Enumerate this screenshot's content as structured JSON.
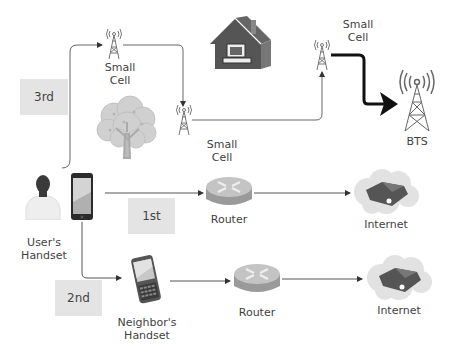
{
  "diagram": {
    "steps": [
      {
        "id": "first",
        "label": "1st"
      },
      {
        "id": "second",
        "label": "2nd"
      },
      {
        "id": "third",
        "label": "3rd"
      }
    ],
    "nodes": {
      "small_cell_a": {
        "label_line1": "Small",
        "label_line2": "Cell"
      },
      "small_cell_b": {
        "label_line1": "Small",
        "label_line2": "Cell"
      },
      "small_cell_c": {
        "label_line1": "Small",
        "label_line2": "Cell"
      },
      "bts": {
        "label": "BTS"
      },
      "users_handset": {
        "label_line1": "User's",
        "label_line2": "Handset"
      },
      "neighbors_handset": {
        "label_line1": "Neighbor's",
        "label_line2": "Handset"
      },
      "router_a": {
        "label": "Router"
      },
      "router_b": {
        "label": "Router"
      },
      "internet_a": {
        "label": "Internet"
      },
      "internet_b": {
        "label": "Internet"
      }
    },
    "icons": [
      "house-icon",
      "tree-icon",
      "person-icon",
      "smartphone-icon",
      "pda-phone-icon",
      "cell-tower-icon",
      "router-icon",
      "internet-cloud-icon"
    ],
    "colors": {
      "line": "#555555",
      "thick_line": "#1a1a1a",
      "step_box": "#e4e4e4",
      "icon_gray": "#666666"
    }
  }
}
